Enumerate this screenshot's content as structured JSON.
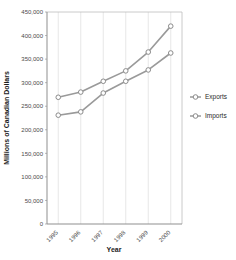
{
  "partial_title": "",
  "chart_data": {
    "type": "line",
    "title": "",
    "xlabel": "Year",
    "ylabel": "Millions of Canadian Dollars",
    "categories": [
      "1995",
      "1996",
      "1997",
      "1998",
      "1999",
      "2000"
    ],
    "series": [
      {
        "name": "Exports",
        "values": [
          269000,
          280000,
          303000,
          325000,
          365000,
          420000
        ]
      },
      {
        "name": "Imports",
        "values": [
          231000,
          238000,
          278000,
          303000,
          327000,
          363000
        ]
      }
    ],
    "ylim": [
      0,
      450000
    ],
    "ytick_values": [
      0,
      50000,
      100000,
      150000,
      200000,
      250000,
      300000,
      350000,
      400000,
      450000
    ],
    "ytick_labels": [
      "0",
      "50,000",
      "100,000",
      "150,000",
      "200,000",
      "250,000",
      "300,000",
      "350,000",
      "400,000",
      "450,000"
    ],
    "grid": true,
    "grid_axis": "x",
    "legend": [
      "Exports",
      "Imports"
    ],
    "legend_position": "right",
    "xtick_rotation": -45,
    "marker": "open-circle",
    "colors": {
      "series_line": "#9a9a9a",
      "marker_stroke": "#8c8c8c",
      "marker_fill": "#ffffff",
      "grid": "#dcdcdc",
      "axis": "#9a9a9a"
    }
  }
}
